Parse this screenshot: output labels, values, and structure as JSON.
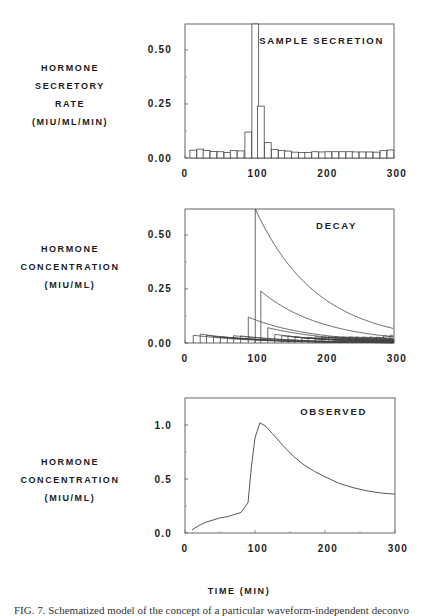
{
  "figure": {
    "x_axis_title": "TIME (MIN)",
    "caption": "FIG. 7. Schematized model of the concept of a particular waveform-independent deconvo"
  },
  "panels": [
    {
      "ylabel_lines": [
        "HORMONE",
        "SECRETORY",
        "RATE",
        "(MIU/ML/MIN)"
      ],
      "title": "SAMPLE SECRETION",
      "yticks": [
        "0.00",
        "0.25",
        "0.50"
      ],
      "xticks": [
        "0",
        "100",
        "200",
        "300"
      ]
    },
    {
      "ylabel_lines": [
        "HORMONE",
        "CONCENTRATION",
        "(MIU/ML)"
      ],
      "title": "DECAY",
      "yticks": [
        "0.00",
        "0.25",
        "0.50"
      ],
      "xticks": [
        "0",
        "100",
        "200",
        "300"
      ]
    },
    {
      "ylabel_lines": [
        "HORMONE",
        "CONCENTRATION",
        "(MIU/ML)"
      ],
      "title": "OBSERVED",
      "yticks": [
        "0.0",
        "0.5",
        "1.0"
      ],
      "xticks": [
        "0",
        "100",
        "200",
        "300"
      ]
    }
  ],
  "chart_data": [
    {
      "type": "bar",
      "title": "SAMPLE SECRETION",
      "xlabel": "TIME (MIN)",
      "ylabel": "HORMONE SECRETORY RATE (MIU/ML/MIN)",
      "xlim": [
        0,
        300
      ],
      "ylim": [
        0,
        0.62
      ],
      "yticks": [
        0.0,
        0.25,
        0.5
      ],
      "xticks": [
        0,
        100,
        200,
        300
      ],
      "bar_width_min": 9.7,
      "bar_starts": [
        7,
        17,
        26,
        36,
        46,
        56,
        65,
        75,
        86,
        96,
        104,
        114,
        124,
        134,
        143,
        153,
        163,
        172,
        182,
        192,
        201,
        211,
        221,
        231,
        240,
        250,
        260,
        270,
        280,
        290
      ],
      "values": [
        0.036,
        0.041,
        0.035,
        0.03,
        0.029,
        0.026,
        0.034,
        0.033,
        0.12,
        0.62,
        0.24,
        0.071,
        0.04,
        0.034,
        0.032,
        0.027,
        0.025,
        0.026,
        0.029,
        0.028,
        0.029,
        0.029,
        0.029,
        0.029,
        0.028,
        0.028,
        0.028,
        0.027,
        0.034,
        0.037
      ]
    },
    {
      "type": "line",
      "title": "DECAY",
      "xlabel": "TIME (MIN)",
      "ylabel": "HORMONE CONCENTRATION (MIU/ML)",
      "xlim": [
        0,
        300
      ],
      "ylim": [
        0,
        0.62
      ],
      "yticks": [
        0.0,
        0.25,
        0.5
      ],
      "xticks": [
        0,
        100,
        200,
        300
      ],
      "decay_rate_per_min": 0.0112,
      "series_note": "Each secretory burst from the SAMPLE SECRETION panel decays exponentially from its onset time",
      "burst_onsets": [
        7,
        17,
        26,
        36,
        46,
        56,
        65,
        75,
        86,
        96,
        104,
        114,
        124,
        134,
        143,
        153,
        163,
        172,
        182,
        192,
        201,
        211,
        221,
        231,
        240,
        250,
        260,
        270,
        280,
        290
      ],
      "burst_amplitudes": [
        0.036,
        0.041,
        0.035,
        0.03,
        0.029,
        0.026,
        0.034,
        0.033,
        0.12,
        0.62,
        0.24,
        0.071,
        0.04,
        0.034,
        0.032,
        0.027,
        0.025,
        0.026,
        0.029,
        0.028,
        0.029,
        0.029,
        0.029,
        0.029,
        0.028,
        0.028,
        0.028,
        0.027,
        0.034,
        0.037
      ]
    },
    {
      "type": "line",
      "title": "OBSERVED",
      "xlabel": "TIME (MIN)",
      "ylabel": "HORMONE CONCENTRATION (MIU/ML)",
      "xlim": [
        0,
        300
      ],
      "ylim": [
        0,
        1.25
      ],
      "yticks": [
        0.0,
        0.5,
        1.0
      ],
      "xticks": [
        0,
        100,
        200,
        300
      ],
      "x": [
        10,
        20,
        30,
        40,
        50,
        60,
        70,
        80,
        90,
        95,
        100,
        107,
        115,
        125,
        140,
        155,
        170,
        185,
        200,
        220,
        240,
        260,
        280,
        290,
        300
      ],
      "y": [
        0.03,
        0.07,
        0.1,
        0.12,
        0.14,
        0.15,
        0.17,
        0.19,
        0.28,
        0.62,
        0.88,
        1.02,
        0.99,
        0.92,
        0.81,
        0.71,
        0.63,
        0.57,
        0.52,
        0.46,
        0.42,
        0.39,
        0.37,
        0.365,
        0.36
      ]
    }
  ]
}
